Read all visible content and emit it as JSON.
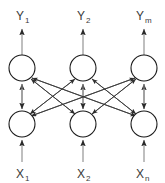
{
  "diagram": {
    "type": "neural-network-bidirectional-associative-memory",
    "title": "",
    "canvas": {
      "width": 165,
      "height": 183,
      "background": "#ffffff"
    },
    "colors": {
      "node_stroke": "#1a1a1a",
      "node_fill": "#ffffff",
      "cross_edge": "#3b3b3b",
      "io_arrow": "#8a8a8a",
      "label_text": "#3a3a3a"
    },
    "layers": [
      {
        "name": "output-layer",
        "role": "Y",
        "nodes": [
          {
            "id": "y1",
            "label_base": "Y",
            "label_sub": "1",
            "cx": 22,
            "cy": 68,
            "r": 13
          },
          {
            "id": "y2",
            "label_base": "Y",
            "label_sub": "2",
            "cx": 83,
            "cy": 68,
            "r": 13
          },
          {
            "id": "ym",
            "label_base": "Y",
            "label_sub": "m",
            "cx": 144,
            "cy": 68,
            "r": 13
          }
        ]
      },
      {
        "name": "input-layer",
        "role": "X",
        "nodes": [
          {
            "id": "x1",
            "label_base": "X",
            "label_sub": "1",
            "cx": 22,
            "cy": 124,
            "r": 13
          },
          {
            "id": "x2",
            "label_base": "X",
            "label_sub": "2",
            "cx": 83,
            "cy": 124,
            "r": 13
          },
          {
            "id": "xn",
            "label_base": "X",
            "label_sub": "n",
            "cx": 144,
            "cy": 124,
            "r": 13
          }
        ]
      }
    ],
    "output_labels": [
      {
        "id": "label-y1",
        "base": "Y",
        "sub": "1",
        "x": 22,
        "y": 18
      },
      {
        "id": "label-y2",
        "base": "Y",
        "sub": "2",
        "x": 83,
        "y": 18
      },
      {
        "id": "label-ym",
        "base": "Y",
        "sub": "m",
        "x": 144,
        "y": 18
      }
    ],
    "input_labels": [
      {
        "id": "label-x1",
        "base": "X",
        "sub": "1",
        "x": 22,
        "y": 175
      },
      {
        "id": "label-x2",
        "base": "X",
        "sub": "2",
        "x": 83,
        "y": 175
      },
      {
        "id": "label-xn",
        "base": "X",
        "sub": "n",
        "x": 144,
        "y": 175
      }
    ],
    "connections": {
      "description": "fully connected bidirectional weights between X and Y layers",
      "cross_pairs": [
        [
          "x1",
          "y2"
        ],
        [
          "x1",
          "ym"
        ],
        [
          "x2",
          "y1"
        ],
        [
          "x2",
          "ym"
        ],
        [
          "xn",
          "y1"
        ],
        [
          "xn",
          "y2"
        ]
      ],
      "vertical_pairs": [
        [
          "x1",
          "y1"
        ],
        [
          "x2",
          "y2"
        ],
        [
          "xn",
          "ym"
        ]
      ],
      "bidirectional": true
    },
    "external_arrows": {
      "outputs_up": [
        "y1",
        "y2",
        "ym"
      ],
      "inputs_up": [
        "x1",
        "x2",
        "xn"
      ]
    }
  }
}
